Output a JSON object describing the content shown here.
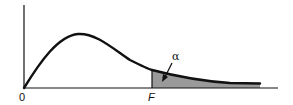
{
  "diagram": {
    "labels": {
      "origin": "0",
      "critical_value": "F",
      "tail_area": "α"
    },
    "colors": {
      "curve": "#111111",
      "axes": "#111111",
      "shaded_region": "#9a9a9a",
      "background": "#ffffff"
    }
  }
}
